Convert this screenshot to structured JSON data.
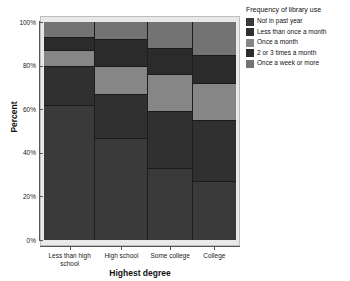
{
  "chart_data": {
    "type": "bar",
    "subtype": "stacked-percent-mosaic",
    "title": "",
    "xlabel": "Highest degree",
    "ylabel": "Percent",
    "ylim": [
      0,
      100
    ],
    "ytick_labels": [
      "0%",
      "20%",
      "40%",
      "60%",
      "80%",
      "100%"
    ],
    "ytick_values": [
      0,
      20,
      40,
      60,
      80,
      100
    ],
    "grid": false,
    "legend_position": "right",
    "legend_title": "Frequency of library use",
    "categories": [
      "Less than high school",
      "High school",
      "Some college",
      "College"
    ],
    "category_widths": [
      51,
      52,
      45,
      43
    ],
    "series": [
      {
        "name": "Not in past year",
        "color": "#3a3a3a",
        "values": [
          62,
          47,
          33,
          27
        ]
      },
      {
        "name": "Less than once a month",
        "color": "#303030",
        "values": [
          18,
          20,
          26,
          28
        ]
      },
      {
        "name": "Once a month",
        "color": "#868686",
        "values": [
          7,
          13,
          17,
          17
        ]
      },
      {
        "name": "2 or 3 times a month",
        "color": "#2b2b2b",
        "values": [
          6,
          12,
          12,
          13
        ]
      },
      {
        "name": "Once a week or more",
        "color": "#737373",
        "values": [
          7,
          8,
          12,
          15
        ]
      }
    ]
  },
  "legend": {
    "title": "Frequency of library use",
    "items": [
      {
        "label": "Not in past year",
        "color": "#3a3a3a"
      },
      {
        "label": "Less than once a month",
        "color": "#303030"
      },
      {
        "label": "Once a month",
        "color": "#868686"
      },
      {
        "label": "2 or 3 times a month",
        "color": "#2b2b2b"
      },
      {
        "label": "Once a week or more",
        "color": "#737373"
      }
    ]
  },
  "axes": {
    "y_title": "Percent",
    "x_title": "Highest degree"
  }
}
